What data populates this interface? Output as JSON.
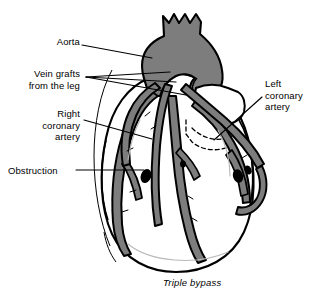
{
  "figure": {
    "caption": "Triple bypass"
  },
  "labels": {
    "aorta": "Aorta",
    "vein_grafts": "Vein grafts\nfrom the leg",
    "right_coronary": "Right\ncoronary\nartery",
    "obstruction": "Obstruction",
    "left_coronary": "Left\ncoronary\nartery"
  },
  "colors": {
    "vessel_gray": "#7d7d7d",
    "aorta_gray": "#7d7d7d",
    "outline_black": "#000000",
    "heart_white": "#ffffff",
    "obstruction_black": "#000000",
    "background": "#ffffff"
  }
}
